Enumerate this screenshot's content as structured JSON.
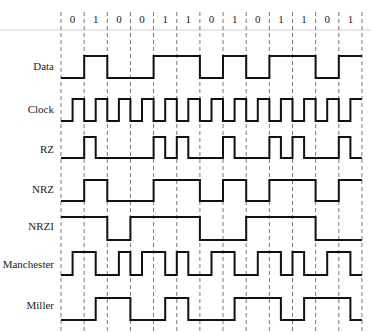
{
  "diagram": {
    "bits": [
      "0",
      "1",
      "0",
      "0",
      "1",
      "1",
      "0",
      "1",
      "0",
      "1",
      "1",
      "0",
      "1"
    ],
    "grid_x_start": 61,
    "bit_width": 23.15,
    "signals": [
      {
        "name": "Data",
        "label_y": 70,
        "high_y": 56,
        "low_y": 78,
        "levels": [
          0,
          0,
          1,
          1,
          0,
          0,
          0,
          0,
          1,
          1,
          1,
          1,
          0,
          0,
          1,
          1,
          0,
          0,
          1,
          1,
          1,
          1,
          0,
          0,
          1,
          1
        ]
      },
      {
        "name": "Clock",
        "label_y": 113,
        "high_y": 99,
        "low_y": 121,
        "levels": [
          0,
          1,
          0,
          1,
          0,
          1,
          0,
          1,
          0,
          1,
          0,
          1,
          0,
          1,
          0,
          1,
          0,
          1,
          0,
          1,
          0,
          1,
          0,
          1,
          0,
          1
        ]
      },
      {
        "name": "RZ",
        "label_y": 153,
        "high_y": 137,
        "low_y": 158,
        "levels": [
          0,
          0,
          1,
          0,
          0,
          0,
          0,
          0,
          1,
          0,
          1,
          0,
          0,
          0,
          1,
          0,
          0,
          0,
          1,
          0,
          1,
          0,
          0,
          0,
          1,
          0
        ]
      },
      {
        "name": "NRZ",
        "label_y": 193,
        "high_y": 180,
        "low_y": 201,
        "levels": [
          0,
          0,
          1,
          1,
          0,
          0,
          0,
          0,
          1,
          1,
          1,
          1,
          0,
          0,
          1,
          1,
          0,
          0,
          1,
          1,
          1,
          1,
          0,
          0,
          1,
          1
        ]
      },
      {
        "name": "NRZI",
        "label_y": 230,
        "high_y": 217,
        "low_y": 240,
        "levels": [
          1,
          1,
          1,
          1,
          0,
          0,
          1,
          1,
          1,
          1,
          1,
          1,
          0,
          0,
          0,
          0,
          1,
          1,
          1,
          1,
          1,
          1,
          0,
          0,
          0,
          0
        ]
      },
      {
        "name": "Manchester",
        "label_y": 268,
        "high_y": 252,
        "low_y": 275,
        "levels": [
          0,
          1,
          1,
          0,
          0,
          1,
          0,
          1,
          1,
          0,
          1,
          0,
          0,
          1,
          1,
          0,
          0,
          1,
          1,
          0,
          1,
          0,
          0,
          1,
          1,
          0
        ]
      },
      {
        "name": "Miller",
        "label_y": 309,
        "high_y": 298,
        "low_y": 320,
        "levels": [
          0,
          0,
          0,
          1,
          1,
          1,
          0,
          0,
          0,
          1,
          1,
          0,
          0,
          0,
          0,
          1,
          1,
          1,
          1,
          0,
          0,
          1,
          1,
          1,
          1,
          0
        ]
      }
    ]
  }
}
